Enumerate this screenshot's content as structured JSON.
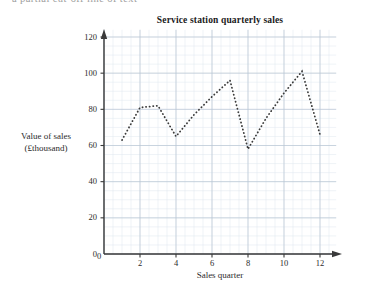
{
  "page": {
    "top_fragment_text": "a partial cut-off line of text"
  },
  "chart_data": {
    "type": "line",
    "title": "Service station quarterly sales",
    "xlabel": "Sales quarter",
    "ylabel_lines": [
      "Value of sales",
      "(£thousand)"
    ],
    "ylabel": "Value of sales (£thousand)",
    "x": [
      1,
      2,
      3,
      4,
      5,
      6,
      7,
      8,
      9,
      10,
      11,
      12
    ],
    "values": [
      63,
      81,
      82,
      65,
      77,
      87,
      96,
      58,
      75,
      89,
      101,
      66
    ],
    "series": [
      {
        "name": "Quarterly sales",
        "values": [
          63,
          81,
          82,
          65,
          77,
          87,
          96,
          58,
          75,
          89,
          101,
          66
        ]
      }
    ],
    "xlim": [
      0,
      12.9
    ],
    "ylim": [
      0,
      124
    ],
    "xticks": [
      0,
      2,
      4,
      6,
      8,
      10,
      12
    ],
    "xtick_labels": [
      "0",
      "2",
      "4",
      "6",
      "8",
      "10",
      "12"
    ],
    "yticks": [
      0,
      20,
      40,
      60,
      80,
      100,
      120
    ],
    "ytick_labels": [
      "0",
      "20",
      "40",
      "60",
      "80",
      "100",
      "120"
    ],
    "grid": true,
    "grid_minor": true,
    "grid_major_color": "#b9c6d4",
    "grid_minor_color": "#dfe7ef",
    "line_style": "dotted",
    "line_color": "#3a3a3a",
    "axis_color": "#3a3a3a",
    "legend": "none"
  }
}
